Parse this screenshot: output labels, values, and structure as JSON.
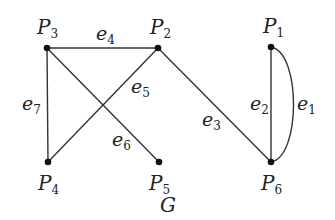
{
  "graph": {
    "title": "G",
    "nodes": [
      {
        "id": "P1",
        "label": "P",
        "sub": "1",
        "x": 271,
        "y": 47,
        "lx": 263,
        "ly": 33
      },
      {
        "id": "P2",
        "label": "P",
        "sub": "2",
        "x": 158,
        "y": 48,
        "lx": 150,
        "ly": 34
      },
      {
        "id": "P3",
        "label": "P",
        "sub": "3",
        "x": 47,
        "y": 48,
        "lx": 37,
        "ly": 34
      },
      {
        "id": "P4",
        "label": "P",
        "sub": "4",
        "x": 48,
        "y": 162,
        "lx": 38,
        "ly": 190
      },
      {
        "id": "P5",
        "label": "P",
        "sub": "5",
        "x": 159,
        "y": 162,
        "lx": 149,
        "ly": 190
      },
      {
        "id": "P6",
        "label": "P",
        "sub": "6",
        "x": 271,
        "y": 162,
        "lx": 261,
        "ly": 190
      }
    ],
    "edges": [
      {
        "id": "e1",
        "label": "e",
        "sub": "1",
        "from": "P1",
        "to": "P6",
        "curved": true,
        "lx": 297,
        "ly": 110
      },
      {
        "id": "e2",
        "label": "e",
        "sub": "2",
        "from": "P1",
        "to": "P6",
        "curved": false,
        "lx": 250,
        "ly": 110
      },
      {
        "id": "e3",
        "label": "e",
        "sub": "3",
        "from": "P2",
        "to": "P6",
        "curved": false,
        "lx": 202,
        "ly": 126
      },
      {
        "id": "e4",
        "label": "e",
        "sub": "4",
        "from": "P3",
        "to": "P2",
        "curved": false,
        "lx": 96,
        "ly": 40
      },
      {
        "id": "e5",
        "label": "e",
        "sub": "5",
        "from": "P2",
        "to": "P4",
        "curved": false,
        "lx": 131,
        "ly": 93
      },
      {
        "id": "e6",
        "label": "e",
        "sub": "6",
        "from": "P3",
        "to": "P5",
        "curved": false,
        "lx": 112,
        "ly": 146
      },
      {
        "id": "e7",
        "label": "e",
        "sub": "7",
        "from": "P3",
        "to": "P4",
        "curved": false,
        "lx": 22,
        "ly": 110
      }
    ],
    "caption": {
      "text": "G",
      "x": 160,
      "y": 212
    }
  }
}
